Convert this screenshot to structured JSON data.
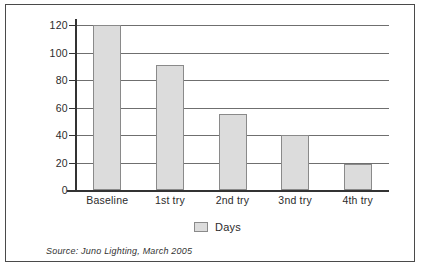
{
  "chart_data": {
    "type": "bar",
    "title": "",
    "xlabel": "",
    "ylabel": "",
    "categories": [
      "Baseline",
      "1st try",
      "2nd try",
      "3nd try",
      "4th try"
    ],
    "values": [
      120,
      91,
      55,
      40,
      19
    ],
    "series": [
      {
        "name": "Days",
        "values": [
          120,
          91,
          55,
          40,
          19
        ]
      }
    ],
    "ylim": [
      0,
      120
    ],
    "ytick_labels": [
      "120",
      "100",
      "80",
      "60",
      "40",
      "20",
      "0"
    ],
    "ytick_values": [
      120,
      100,
      80,
      60,
      40,
      20,
      0
    ],
    "grid": true,
    "legend_position": "bottom",
    "legend": [
      "Days"
    ],
    "annotations": [
      "Source: Juno Lighting, March 2005"
    ],
    "bar_fill_color": "#dcdcdc",
    "bar_border_color": "#8a8a8a"
  },
  "legend": {
    "label": "Days",
    "swatch_name": "days-swatch"
  },
  "source": {
    "text": "Source: Juno Lighting, March 2005"
  }
}
